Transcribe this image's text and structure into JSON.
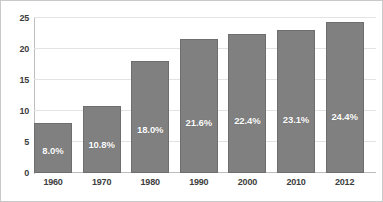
{
  "chart_data": {
    "type": "bar",
    "title": "",
    "subtitle": "",
    "xlabel": "",
    "ylabel": "",
    "categories": [
      "1960",
      "1970",
      "1980",
      "1990",
      "2000",
      "2010",
      "2012"
    ],
    "values": [
      8.0,
      10.8,
      18.0,
      21.6,
      22.4,
      23.1,
      24.4
    ],
    "data_labels": [
      "8.0%",
      "10.8%",
      "18.0%",
      "21.6%",
      "22.4%",
      "23.1%",
      "24.4%"
    ],
    "ylim": [
      0,
      25
    ],
    "ytick_labels": [
      "25",
      "20",
      "15",
      "10",
      "5",
      "0"
    ],
    "ytick_values": [
      25,
      20,
      15,
      10,
      5,
      0
    ],
    "grid": true,
    "legend": "none",
    "series": [
      {
        "name": "",
        "values": [
          8.0,
          10.8,
          18.0,
          21.6,
          22.4,
          23.1,
          24.4
        ]
      }
    ],
    "colors": {
      "bar_fill": "#808080",
      "bar_border": "#6e6e6e",
      "gridline": "#e3e3e3",
      "axis": "#bdbdbd",
      "label_text": "#3d3d3d",
      "value_text": "#ffffff",
      "background": "#ffffff",
      "frame_border": "#c9c9c9"
    }
  }
}
